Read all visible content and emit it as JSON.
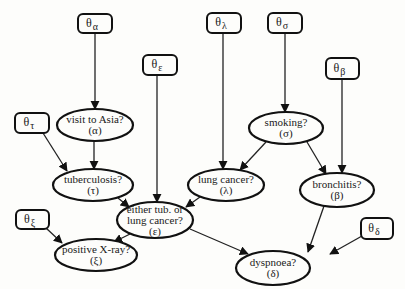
{
  "diagram": {
    "type": "bayesian-network",
    "parameters": [
      {
        "id": "theta_alpha",
        "symbol": "θ",
        "sub": "α",
        "x": 78,
        "y": 14,
        "w": 34,
        "h": 19
      },
      {
        "id": "theta_epsilon",
        "symbol": "θ",
        "sub": "ε",
        "x": 143,
        "y": 55,
        "w": 34,
        "h": 20
      },
      {
        "id": "theta_lambda",
        "symbol": "θ",
        "sub": "λ",
        "x": 207,
        "y": 13,
        "w": 34,
        "h": 20
      },
      {
        "id": "theta_sigma",
        "symbol": "θ",
        "sub": "σ",
        "x": 268,
        "y": 13,
        "w": 34,
        "h": 20
      },
      {
        "id": "theta_beta",
        "symbol": "θ",
        "sub": "β",
        "x": 326,
        "y": 58,
        "w": 33,
        "h": 21
      },
      {
        "id": "theta_tau",
        "symbol": "θ",
        "sub": "τ",
        "x": 15,
        "y": 113,
        "w": 34,
        "h": 20
      },
      {
        "id": "theta_xi",
        "symbol": "θ",
        "sub": "ξ",
        "x": 16,
        "y": 210,
        "w": 33,
        "h": 19
      },
      {
        "id": "theta_delta",
        "symbol": "θ",
        "sub": "δ",
        "x": 361,
        "y": 218,
        "w": 32,
        "h": 21
      }
    ],
    "nodes": [
      {
        "id": "asia",
        "line1": "visit to Asia?",
        "line2": "(α)",
        "cx": 95,
        "cy": 125,
        "rx": 38,
        "ry": 16
      },
      {
        "id": "smoking",
        "line1": "smoking?",
        "line2": "(σ)",
        "cx": 286,
        "cy": 128,
        "rx": 37,
        "ry": 16
      },
      {
        "id": "tuberculosis",
        "line1": "tuberculosis?",
        "line2": "(τ)",
        "cx": 93,
        "cy": 185,
        "rx": 40,
        "ry": 16
      },
      {
        "id": "lung_cancer",
        "line1": "lung cancer?",
        "line2": "(λ)",
        "cx": 226,
        "cy": 185,
        "rx": 38,
        "ry": 16
      },
      {
        "id": "bronchitis",
        "line1": "bronchitis?",
        "line2": "(β)",
        "cx": 337,
        "cy": 190,
        "rx": 37,
        "ry": 17
      },
      {
        "id": "either",
        "line1": "either tub. or",
        "line2": "lung cancer?",
        "line3": "(ε)",
        "cx": 155,
        "cy": 220,
        "rx": 38,
        "ry": 18
      },
      {
        "id": "xray",
        "line1": "positive X-ray?",
        "line2": "(ξ)",
        "cx": 96,
        "cy": 255,
        "rx": 41,
        "ry": 16
      },
      {
        "id": "dyspnoea",
        "line1": "dyspnoea?",
        "line2": "(δ)",
        "cx": 273,
        "cy": 268,
        "rx": 37,
        "ry": 17
      }
    ],
    "edges": [
      {
        "from": "theta_alpha",
        "to": "asia",
        "x1": 95,
        "y1": 33,
        "x2": 95,
        "y2": 109
      },
      {
        "from": "theta_sigma",
        "to": "smoking",
        "x1": 285,
        "y1": 33,
        "x2": 285,
        "y2": 112
      },
      {
        "from": "theta_lambda",
        "to": "lung_cancer",
        "x1": 223,
        "y1": 33,
        "x2": 223,
        "y2": 169
      },
      {
        "from": "theta_epsilon",
        "to": "either",
        "x1": 157,
        "y1": 75,
        "x2": 157,
        "y2": 202
      },
      {
        "from": "theta_beta",
        "to": "bronchitis",
        "x1": 342,
        "y1": 79,
        "x2": 342,
        "y2": 173
      },
      {
        "from": "theta_tau",
        "to": "tuberculosis",
        "x1": 43,
        "y1": 133,
        "x2": 67,
        "y2": 171
      },
      {
        "from": "asia",
        "to": "tuberculosis",
        "x1": 94,
        "y1": 141,
        "x2": 94,
        "y2": 169
      },
      {
        "from": "smoking",
        "to": "lung_cancer",
        "x1": 266,
        "y1": 142,
        "x2": 240,
        "y2": 170
      },
      {
        "from": "smoking",
        "to": "bronchitis",
        "x1": 307,
        "y1": 142,
        "x2": 326,
        "y2": 174
      },
      {
        "from": "tuberculosis",
        "to": "either",
        "x1": 118,
        "y1": 198,
        "x2": 129,
        "y2": 207
      },
      {
        "from": "lung_cancer",
        "to": "either",
        "x1": 200,
        "y1": 197,
        "x2": 186,
        "y2": 207
      },
      {
        "from": "either",
        "to": "xray",
        "x1": 130,
        "y1": 234,
        "x2": 114,
        "y2": 242
      },
      {
        "from": "theta_xi",
        "to": "xray",
        "x1": 46,
        "y1": 228,
        "x2": 62,
        "y2": 243
      },
      {
        "from": "either",
        "to": "dyspnoea",
        "x1": 190,
        "y1": 229,
        "x2": 248,
        "y2": 254
      },
      {
        "from": "bronchitis",
        "to": "dyspnoea",
        "x1": 324,
        "y1": 206,
        "x2": 308,
        "y2": 252
      },
      {
        "from": "theta_delta",
        "to": "dyspnoea",
        "x1": 362,
        "y1": 236,
        "x2": 330,
        "y2": 254
      }
    ]
  },
  "colors": {
    "stroke": "#111111",
    "background": "#fdfdfb",
    "text": "#1a1a1a"
  }
}
